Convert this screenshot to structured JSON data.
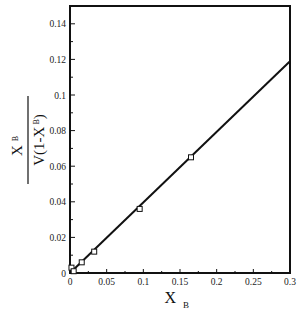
{
  "chart_data": {
    "type": "scatter",
    "title": "",
    "xlabel": "X_B",
    "xlabel_main": "X",
    "xlabel_sub": "B",
    "ylabel": "X_B / V(1-X_B)",
    "ylabel_numerator_main": "X",
    "ylabel_numerator_sub": "B",
    "ylabel_denominator_main": "V(1-X",
    "ylabel_denominator_sub": "B",
    "ylabel_denominator_close": ")",
    "xlim": [
      0,
      0.3
    ],
    "ylim": [
      0,
      0.15
    ],
    "xticks": [
      0,
      0.05,
      0.1,
      0.15,
      0.2,
      0.25,
      0.3
    ],
    "xtick_labels": [
      "0",
      "0.05",
      "0.1",
      "0.15",
      "0.2",
      "0.25",
      "0.3"
    ],
    "yticks": [
      0,
      0.02,
      0.04,
      0.06,
      0.08,
      0.1,
      0.12,
      0.14
    ],
    "ytick_labels": [
      "0",
      "0.02",
      "0.04",
      "0.06",
      "0.08",
      "0.1",
      "0.12",
      "0.14"
    ],
    "grid": false,
    "legend": null,
    "series": [
      {
        "name": "data",
        "marker": "open-square",
        "x": [
          0.002,
          0.005,
          0.016,
          0.033,
          0.095,
          0.165
        ],
        "y": [
          0.003,
          0.001,
          0.006,
          0.012,
          0.036,
          0.065
        ]
      },
      {
        "name": "fit",
        "style": "line",
        "x": [
          0,
          0.3
        ],
        "y": [
          0,
          0.119
        ]
      }
    ]
  }
}
